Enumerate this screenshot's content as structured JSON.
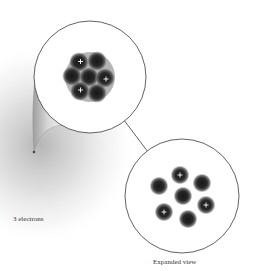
{
  "diagram": {
    "labels": {
      "electrons": "3 electrons",
      "expanded_view": "Expanded view"
    },
    "colors": {
      "background": "#ffffff",
      "electron_cloud": "#bdbdbd",
      "particle_core": "#1e1e1e",
      "circle_outline": "#3a3a3a",
      "plus_sign": "#ffffff"
    },
    "nucleus_closeup": {
      "particle_count": 7,
      "protons": 3,
      "neutrons": 4,
      "proton_symbol": "+"
    },
    "expanded_view": {
      "particles": [
        {
          "type": "proton",
          "symbol": "+"
        },
        {
          "type": "neutron",
          "symbol": ""
        },
        {
          "type": "neutron",
          "symbol": ""
        },
        {
          "type": "neutron",
          "symbol": ""
        },
        {
          "type": "proton",
          "symbol": "+"
        },
        {
          "type": "proton",
          "symbol": "+"
        },
        {
          "type": "neutron",
          "symbol": ""
        }
      ]
    }
  }
}
